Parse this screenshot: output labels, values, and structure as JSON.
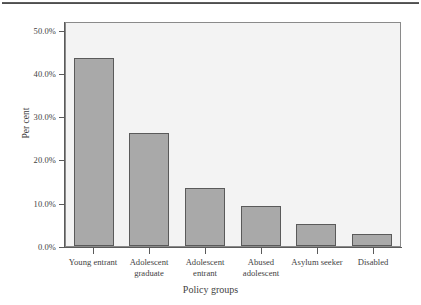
{
  "chart_data": {
    "type": "bar",
    "title": "",
    "subtitle": "",
    "xlabel": "Policy groups",
    "ylabel": "Per cent",
    "categories": [
      "Young entrant",
      "Adolescent graduate",
      "Adolescent entrant",
      "Abused adolescent",
      "Asylum seeker",
      "Disabled"
    ],
    "category_lines": [
      [
        "Young entrant"
      ],
      [
        "Adolescent",
        "graduate"
      ],
      [
        "Adolescent",
        "entrant"
      ],
      [
        "Abused",
        "adolescent"
      ],
      [
        "Asylum seeker"
      ],
      [
        "Disabled"
      ]
    ],
    "values": [
      43.5,
      26.2,
      13.5,
      9.2,
      5.1,
      2.8
    ],
    "value_labels": [
      "43.5%",
      "26.2%",
      "13.5%",
      "9.2%",
      "5.1%",
      "2.8%"
    ],
    "ylim": [
      0,
      52
    ],
    "yticks": [
      0,
      10,
      20,
      30,
      40,
      50
    ],
    "ytick_labels": [
      "0.0%",
      "10.0%",
      "20.0%",
      "30.0%",
      "40.0%",
      "50.0%"
    ],
    "grid": false,
    "legend": false,
    "legend_position": "none",
    "bar_fill_color": "#a9a9a9",
    "bar_border_color": "#5a5a5a",
    "plot_background_color": "#f3f3f3",
    "axis_color": "#5a5a5a",
    "text_color": "#3f3f3f"
  },
  "axes": {
    "y_title": "Per cent",
    "x_title": "Policy groups",
    "y_labels": {
      "t0": "0.0%",
      "t1": "10.0%",
      "t2": "20.0%",
      "t3": "30.0%",
      "t4": "40.0%",
      "t5": "50.0%"
    },
    "x_labels": {
      "c0l0": "Young entrant",
      "c1l0": "Adolescent",
      "c1l1": "graduate",
      "c2l0": "Adolescent",
      "c2l1": "entrant",
      "c3l0": "Abused",
      "c3l1": "adolescent",
      "c4l0": "Asylum seeker",
      "c5l0": "Disabled"
    }
  }
}
